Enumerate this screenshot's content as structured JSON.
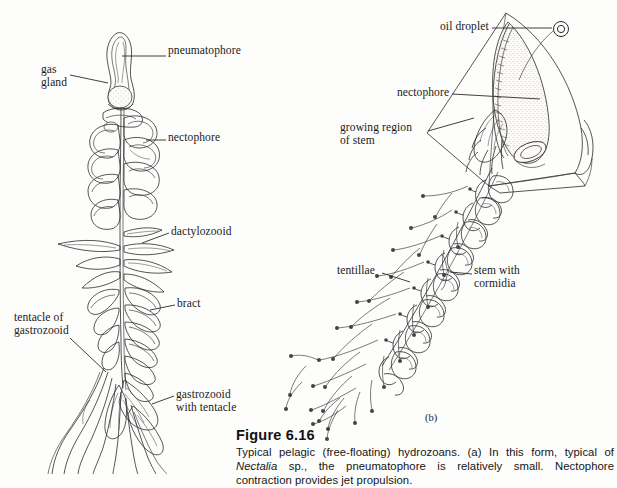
{
  "figure": {
    "number_label": "Figure 6.16",
    "caption": "Typical pelagic (free-floating) hydrozoans. (a) In this form, typical of Nectalia sp., the pneumatophore is relatively small. Nectophore contraction provides jet propulsion.",
    "caption_italic_term": "Nectalia"
  },
  "panels": [
    {
      "tag": "(b)",
      "x": 425,
      "y": 412
    }
  ],
  "labels_left": [
    {
      "id": "pneumatophore",
      "text": "pneumatophore",
      "x": 168,
      "y": 51,
      "leader": {
        "x1": 166,
        "y1": 56,
        "x2": 118,
        "y2": 56
      }
    },
    {
      "id": "gas-gland",
      "text": "gas\ngland",
      "x": 41,
      "y": 68,
      "leader": {
        "x1": 68,
        "y1": 75,
        "x2": 105,
        "y2": 75
      }
    },
    {
      "id": "nectophore",
      "text": "nectophore",
      "x": 168,
      "y": 135,
      "leader": {
        "x1": 166,
        "y1": 140,
        "x2": 145,
        "y2": 140
      }
    },
    {
      "id": "dactylozooid",
      "text": "dactylozooid",
      "x": 171,
      "y": 228,
      "leader": {
        "x1": 169,
        "y1": 233,
        "x2": 139,
        "y2": 245
      }
    },
    {
      "id": "bract",
      "text": "bract",
      "x": 177,
      "y": 300,
      "leader": {
        "x1": 175,
        "y1": 305,
        "x2": 148,
        "y2": 310
      }
    },
    {
      "id": "tentacle-of-gastrozooid",
      "text": "tentacle of\ngastrozooid",
      "x": 16,
      "y": 315,
      "leader": {
        "x1": 72,
        "y1": 338,
        "x2": 104,
        "y2": 368
      }
    },
    {
      "id": "gastrozooid-with-tentacle",
      "text": "gastrozooid\nwith tentacle",
      "x": 176,
      "y": 391,
      "leader": {
        "x1": 174,
        "y1": 396,
        "x2": 150,
        "y2": 405
      }
    }
  ],
  "labels_right": [
    {
      "id": "oil-droplet",
      "text": "oil droplet",
      "x": 440,
      "y": 22,
      "leader": {
        "x1": 492,
        "y1": 28,
        "x2": 548,
        "y2": 28
      }
    },
    {
      "id": "nectophore",
      "text": "nectophore",
      "x": 398,
      "y": 88,
      "leader": {
        "x1": 452,
        "y1": 94,
        "x2": 540,
        "y2": 97
      }
    },
    {
      "id": "growing-region-of-stem",
      "text": "growing region\nof stem",
      "x": 340,
      "y": 124,
      "leader": {
        "x1": 428,
        "y1": 131,
        "x2": 468,
        "y2": 120
      }
    },
    {
      "id": "tentillae",
      "text": "tentillae",
      "x": 338,
      "y": 267,
      "leader": {
        "x1": 382,
        "y1": 273,
        "x2": 408,
        "y2": 280
      }
    },
    {
      "id": "stem-with-cormidia",
      "text": "stem with\ncormidia",
      "x": 474,
      "y": 268,
      "leader": {
        "x1": 472,
        "y1": 274,
        "x2": 448,
        "y2": 276
      }
    }
  ],
  "colors": {
    "background": "#fdfdfc",
    "ink": "#2a2a2a",
    "text": "#1a1a1a",
    "caption_heading": "#121212"
  },
  "icons": {
    "oil_droplet": "oil-droplet-icon"
  }
}
